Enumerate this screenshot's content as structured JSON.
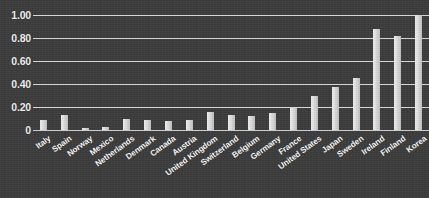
{
  "chart_data": {
    "type": "bar",
    "title": "",
    "xlabel": "",
    "ylabel": "",
    "ylim": [
      0,
      1.0
    ],
    "grid": true,
    "legend": false,
    "categories": [
      "Italy",
      "Spain",
      "Norway",
      "Mexico",
      "Netherlands",
      "Denmark",
      "Canada",
      "Austria",
      "United Kingdom",
      "Switzerland",
      "Belgium",
      "Germany",
      "France",
      "United States",
      "Japan",
      "Sweden",
      "Ireland",
      "Finland",
      "Korea"
    ],
    "values": [
      0.09,
      0.13,
      0.02,
      0.03,
      0.1,
      0.09,
      0.08,
      0.09,
      0.16,
      0.13,
      0.12,
      0.15,
      0.19,
      0.3,
      0.37,
      0.45,
      0.88,
      0.82,
      1.0
    ],
    "ytick_labels": [
      "1.00",
      "0.80",
      "0.60",
      "0.40",
      "0.20",
      "0"
    ],
    "ytick_values": [
      1.0,
      0.8,
      0.6,
      0.4,
      0.2,
      0
    ],
    "colors": {
      "background": "#3c3c3c",
      "gridline": "#d8d8d8",
      "bar": "#e0e0e0",
      "text": "#f7f7f7"
    }
  }
}
